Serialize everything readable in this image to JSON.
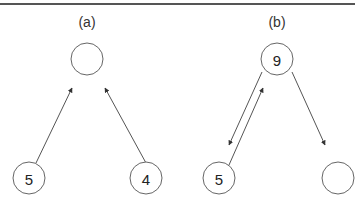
{
  "panels": [
    {
      "label": "(a)",
      "label_pos": [
        87,
        22
      ],
      "nodes": [
        {
          "id": "a-root",
          "value": "",
          "cx": 87,
          "cy": 59
        },
        {
          "id": "a-left",
          "value": "5",
          "cx": 29,
          "cy": 178
        },
        {
          "id": "a-right",
          "value": "4",
          "cx": 146,
          "cy": 178
        }
      ],
      "edges": [
        {
          "from": "a-left",
          "to": "a-root",
          "x1": 36,
          "y1": 163,
          "x2": 72,
          "y2": 88
        },
        {
          "from": "a-right",
          "to": "a-root",
          "x1": 146,
          "y1": 163,
          "x2": 105,
          "y2": 88
        }
      ]
    },
    {
      "label": "(b)",
      "label_pos": [
        277,
        22
      ],
      "nodes": [
        {
          "id": "b-root",
          "value": "9",
          "cx": 277,
          "cy": 59
        },
        {
          "id": "b-left",
          "value": "5",
          "cx": 219,
          "cy": 178
        },
        {
          "id": "b-right",
          "value": "",
          "cx": 338,
          "cy": 178
        }
      ],
      "edges": [
        {
          "from": "b-root",
          "to": "b-left",
          "x1": 262,
          "y1": 72,
          "x2": 229,
          "y2": 145
        },
        {
          "from": "b-left",
          "to": "b-root",
          "x1": 229,
          "y1": 165,
          "x2": 263,
          "y2": 88
        },
        {
          "from": "b-root",
          "to": "b-right",
          "x1": 292,
          "y1": 72,
          "x2": 325,
          "y2": 145
        }
      ]
    }
  ],
  "node_radius": 16,
  "colors": {
    "stroke": "#666666",
    "edge": "#555555",
    "text": "#222222",
    "rule": "#555555"
  }
}
